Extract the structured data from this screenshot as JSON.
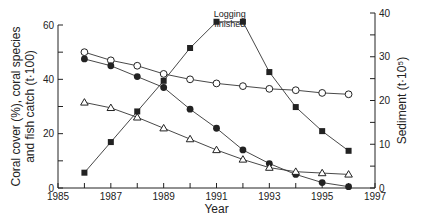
{
  "chart_data": {
    "type": "line",
    "title": "",
    "xlabel": "Year",
    "ylabel": "Coral cover (%), coral species and fish catch (t·100)",
    "ylabel_lines": [
      "Coral cover (%), coral species",
      "and fish catch (t·100)"
    ],
    "y2label": "Sediment (t·10⁵)",
    "xlim": [
      1985,
      1997
    ],
    "ylim": [
      0,
      60
    ],
    "y2lim": [
      0,
      40
    ],
    "x_ticks": [
      1985,
      1986,
      1987,
      1988,
      1989,
      1990,
      1991,
      1992,
      1993,
      1994,
      1995,
      1996,
      1997
    ],
    "x_tick_labels": [
      "1985",
      "1987",
      "1989",
      "1991",
      "1993",
      "1995",
      "1997"
    ],
    "y_ticks": [
      0,
      10,
      20,
      30,
      40,
      50,
      60
    ],
    "y_tick_labels": [
      "0",
      "20",
      "40",
      "60"
    ],
    "y2_ticks": [
      0,
      5,
      10,
      15,
      20,
      25,
      30,
      35,
      40
    ],
    "y2_tick_labels": [
      "0",
      "10",
      "20",
      "30",
      "40"
    ],
    "grid": false,
    "annotation": {
      "text_line1": "Logging",
      "text_line2": "finished",
      "x": 1991.5
    },
    "x": [
      1986,
      1987,
      1988,
      1989,
      1990,
      1991,
      1992,
      1993,
      1994,
      1995,
      1996
    ],
    "series": [
      {
        "name": "open circles",
        "marker": "open-circle",
        "axis": "left",
        "values": [
          50,
          47,
          45,
          42,
          40,
          38.5,
          37.5,
          36.5,
          36,
          35,
          34.5
        ]
      },
      {
        "name": "filled circles",
        "marker": "filled-circle",
        "axis": "left",
        "values": [
          47.5,
          45,
          41,
          37,
          29,
          22,
          14,
          9,
          5,
          2,
          0.5
        ]
      },
      {
        "name": "open triangles",
        "marker": "open-triangle",
        "axis": "left",
        "values": [
          31.5,
          29.5,
          26,
          22,
          18,
          14,
          10.5,
          7.5,
          6,
          5.5,
          5
        ]
      },
      {
        "name": "filled squares (sediment)",
        "marker": "filled-square",
        "axis": "right",
        "values": [
          3.5,
          10.5,
          17.5,
          24.5,
          32,
          38,
          38,
          26.5,
          18.5,
          13,
          8.5
        ]
      }
    ]
  }
}
